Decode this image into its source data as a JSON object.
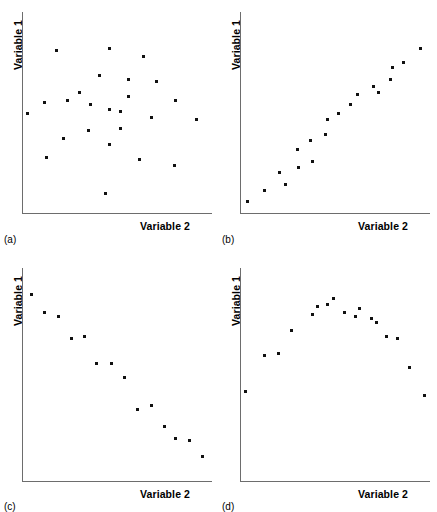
{
  "figure": {
    "background_color": "#ffffff",
    "dot_color": "#111111",
    "axis_color": "#6d6d6d"
  },
  "panels": [
    {
      "tag": "(a)",
      "xlabel": "Variable 2",
      "ylabel": "Variable 1",
      "caption": "no relationship / random scatter"
    },
    {
      "tag": "(b)",
      "xlabel": "Variable 2",
      "ylabel": "Variable 1",
      "caption": "strong positive linear relationship"
    },
    {
      "tag": "(c)",
      "xlabel": "Variable 2",
      "ylabel": "Variable 1",
      "caption": "strong negative linear relationship"
    },
    {
      "tag": "(d)",
      "xlabel": "Variable 2",
      "ylabel": "Variable 1",
      "caption": "curvilinear inverted-U relationship"
    }
  ],
  "chart_data": [
    {
      "type": "scatter",
      "panel": "(a)",
      "title": "",
      "xlabel": "Variable 2",
      "ylabel": "Variable 1",
      "xlim": [
        0,
        100
      ],
      "ylim": [
        0,
        100
      ],
      "grid": false,
      "legend": "none",
      "points": [
        {
          "x": 18,
          "y": 85
        },
        {
          "x": 46,
          "y": 86
        },
        {
          "x": 64,
          "y": 82
        },
        {
          "x": 41,
          "y": 72
        },
        {
          "x": 56,
          "y": 70
        },
        {
          "x": 71,
          "y": 69
        },
        {
          "x": 30,
          "y": 63
        },
        {
          "x": 56,
          "y": 61
        },
        {
          "x": 12,
          "y": 58
        },
        {
          "x": 24,
          "y": 59
        },
        {
          "x": 81,
          "y": 59
        },
        {
          "x": 36,
          "y": 57
        },
        {
          "x": 46,
          "y": 54
        },
        {
          "x": 52,
          "y": 53
        },
        {
          "x": 3,
          "y": 52
        },
        {
          "x": 68,
          "y": 50
        },
        {
          "x": 92,
          "y": 49
        },
        {
          "x": 35,
          "y": 43
        },
        {
          "x": 52,
          "y": 44
        },
        {
          "x": 22,
          "y": 39
        },
        {
          "x": 46,
          "y": 36
        },
        {
          "x": 13,
          "y": 29
        },
        {
          "x": 62,
          "y": 28
        },
        {
          "x": 80,
          "y": 25
        },
        {
          "x": 44,
          "y": 10
        }
      ]
    },
    {
      "type": "scatter",
      "panel": "(b)",
      "title": "",
      "xlabel": "Variable 2",
      "ylabel": "Variable 1",
      "xlim": [
        0,
        100
      ],
      "ylim": [
        0,
        100
      ],
      "grid": false,
      "legend": "none",
      "points": [
        {
          "x": 4,
          "y": 6
        },
        {
          "x": 13,
          "y": 12
        },
        {
          "x": 24,
          "y": 15
        },
        {
          "x": 21,
          "y": 21
        },
        {
          "x": 31,
          "y": 24
        },
        {
          "x": 38,
          "y": 27
        },
        {
          "x": 30,
          "y": 33
        },
        {
          "x": 37,
          "y": 38
        },
        {
          "x": 45,
          "y": 41
        },
        {
          "x": 46,
          "y": 49
        },
        {
          "x": 52,
          "y": 52
        },
        {
          "x": 58,
          "y": 57
        },
        {
          "x": 62,
          "y": 62
        },
        {
          "x": 70,
          "y": 66
        },
        {
          "x": 73,
          "y": 63
        },
        {
          "x": 79,
          "y": 70
        },
        {
          "x": 80,
          "y": 76
        },
        {
          "x": 86,
          "y": 79
        },
        {
          "x": 95,
          "y": 86
        }
      ]
    },
    {
      "type": "scatter",
      "panel": "(c)",
      "title": "",
      "xlabel": "Variable 2",
      "ylabel": "Variable 1",
      "xlim": [
        0,
        100
      ],
      "ylim": [
        0,
        100
      ],
      "grid": false,
      "legend": "none",
      "points": [
        {
          "x": 5,
          "y": 92
        },
        {
          "x": 12,
          "y": 83
        },
        {
          "x": 19,
          "y": 81
        },
        {
          "x": 26,
          "y": 70
        },
        {
          "x": 33,
          "y": 71
        },
        {
          "x": 39,
          "y": 58
        },
        {
          "x": 47,
          "y": 58
        },
        {
          "x": 54,
          "y": 51
        },
        {
          "x": 61,
          "y": 35
        },
        {
          "x": 68,
          "y": 37
        },
        {
          "x": 75,
          "y": 27
        },
        {
          "x": 81,
          "y": 21
        },
        {
          "x": 88,
          "y": 20
        },
        {
          "x": 95,
          "y": 12
        }
      ]
    },
    {
      "type": "scatter",
      "panel": "(d)",
      "title": "",
      "xlabel": "Variable 2",
      "ylabel": "Variable 1",
      "xlim": [
        0,
        100
      ],
      "ylim": [
        0,
        100
      ],
      "grid": false,
      "legend": "none",
      "points": [
        {
          "x": 3,
          "y": 44
        },
        {
          "x": 13,
          "y": 62
        },
        {
          "x": 20,
          "y": 63
        },
        {
          "x": 27,
          "y": 74
        },
        {
          "x": 38,
          "y": 82
        },
        {
          "x": 41,
          "y": 86
        },
        {
          "x": 46,
          "y": 87
        },
        {
          "x": 49,
          "y": 90
        },
        {
          "x": 55,
          "y": 83
        },
        {
          "x": 61,
          "y": 81
        },
        {
          "x": 63,
          "y": 85
        },
        {
          "x": 69,
          "y": 80
        },
        {
          "x": 72,
          "y": 78
        },
        {
          "x": 77,
          "y": 71
        },
        {
          "x": 83,
          "y": 70
        },
        {
          "x": 89,
          "y": 56
        },
        {
          "x": 97,
          "y": 42
        }
      ]
    }
  ]
}
